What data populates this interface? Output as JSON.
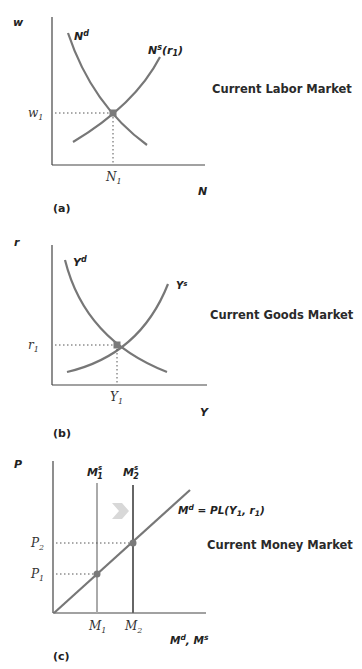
{
  "panels": [
    {
      "id": "a",
      "panel_label": "(a)",
      "title": "Current Labor Market",
      "y_axis_label": "w",
      "x_axis_label": "N",
      "demand_label": "N",
      "demand_sup": "d",
      "supply_label": "N",
      "supply_sup": "s",
      "supply_arg": "(r",
      "supply_arg_sub": "1",
      "supply_arg_close": ")",
      "eq_y_label": "w",
      "eq_y_sub": "1",
      "eq_x_label": "N",
      "eq_x_sub": "1"
    },
    {
      "id": "b",
      "panel_label": "(b)",
      "title": "Current Goods Market",
      "y_axis_label": "r",
      "x_axis_label": "Y",
      "demand_label": "Y",
      "demand_sup": "d",
      "supply_label": "Y",
      "supply_sup": "s",
      "eq_y_label": "r",
      "eq_y_sub": "1",
      "eq_x_label": "Y",
      "eq_x_sub": "1"
    },
    {
      "id": "c",
      "panel_label": "(c)",
      "title": "Current Money Market",
      "y_axis_label": "P",
      "x_axis_label": "M",
      "x_axis_sup1": "d",
      "x_axis_sep": ", M",
      "x_axis_sup2": "s",
      "supply1_label": "M",
      "supply1_sup": "s",
      "supply1_sub": "1",
      "supply2_label": "M",
      "supply2_sup": "s",
      "supply2_sub": "2",
      "demand_label": "M",
      "demand_sup": "d",
      "demand_eq": " = PL(Y",
      "demand_sub": "1",
      "demand_tail": ", r",
      "demand_sub2": "1",
      "demand_close": ")",
      "p1_label": "P",
      "p1_sub": "1",
      "p2_label": "P",
      "p2_sub": "2",
      "m1_label": "M",
      "m1_sub": "1",
      "m2_label": "M",
      "m2_sub": "2"
    }
  ],
  "colors": {
    "axis": "#444444",
    "curve": "#777777",
    "m1_line": "#aaaaaa",
    "m2_line": "#666666",
    "dot": "#7a7a7a",
    "arrow": "#d8d8d8"
  }
}
